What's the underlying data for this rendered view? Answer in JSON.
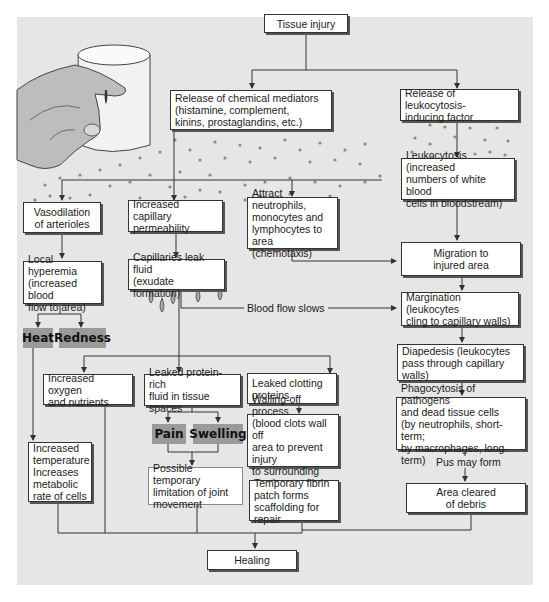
{
  "diagram": {
    "nodes": {
      "tissue_injury": "Tissue injury",
      "chemical_mediators": "Release of chemical mediators\n(histamine, complement,\nkinins, prostaglandins, etc.)",
      "leukocytosis_factor": "Release of leukocytosis-\ninducing factor",
      "leukocytosis": "Leukocytosis (increased\nnumbers of white blood\ncells in bloodstream)",
      "vasodilation": "Vasodilation\nof arterioles",
      "capillary_permeability": "Increased capillary\npermeability",
      "attract_neutrophils": "Attract neutrophils,\nmonocytes and\nlymphocytes to\narea (chemotaxis)",
      "migration": "Migration to\ninjured area",
      "local_hyperemia": "Local hyperemia\n(increased blood\nflow to area)",
      "capillaries_leak": "Capillaries leak fluid\n(exudate formation)",
      "margination": "Margination (leukocytes\ncling to capillary walls)",
      "diapedesis": "Diapedesis (leukocytes\npass through capillary walls)",
      "increased_oxygen": "Increased oxygen\nand nutrients",
      "leaked_protein": "Leaked protein-rich\nfluid in tissue spaces",
      "leaked_clotting": "Leaked clotting\nproteins",
      "walling_off": "Walling-off process\n(blood clots wall off\narea to prevent injury\nto surrounding area)",
      "phagocytosis": "Phagocytosis of pathogens\nand dead tissue cells\n(by neutrophils, short-term;\nby macrophages, long-term)",
      "increased_temperature": "Increased\ntemperature\nIncreases\nmetabolic\nrate of cells",
      "joint_limitation": "Possible temporary\nlimitation of joint\nmovement",
      "fibrin_patch": "Temporary fibrin\npatch forms\nscaffolding for repair",
      "area_cleared": "Area cleared\nof debris",
      "healing": "Healing"
    },
    "signs": {
      "heat": "Heat",
      "redness": "Redness",
      "pain": "Pain",
      "swelling": "Swelling"
    },
    "edge_labels": {
      "blood_flow_slows": "Blood flow slows",
      "pus_may_form": "Pus may form"
    },
    "colors": {
      "panel": "#e6e6e6",
      "box": "#ffffff",
      "sign": "#9a9a9a",
      "line": "#333333"
    }
  }
}
